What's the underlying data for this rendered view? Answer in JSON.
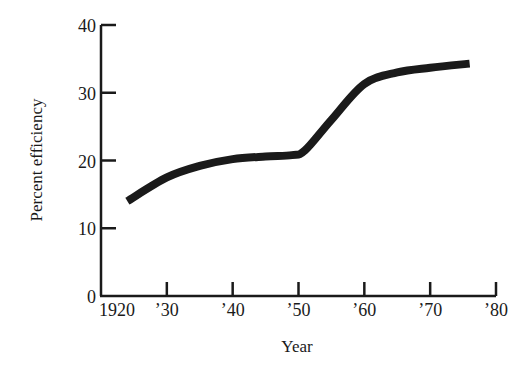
{
  "chart_data": {
    "type": "line",
    "title": "",
    "xlabel": "Year",
    "ylabel": "Percent efficiency",
    "xlim": [
      1920,
      1980
    ],
    "ylim": [
      0,
      40
    ],
    "x_ticks": [
      1920,
      1930,
      1940,
      1950,
      1960,
      1970,
      1980
    ],
    "x_tick_labels": [
      "1920",
      "’30",
      "’40",
      "’50",
      "’60",
      "’70",
      "’80"
    ],
    "y_ticks": [
      0,
      10,
      20,
      30,
      40
    ],
    "y_tick_labels": [
      "0",
      "10",
      "20",
      "30",
      "40"
    ],
    "grid": false,
    "legend": null,
    "series": [
      {
        "name": "Efficiency",
        "color": "#1a1a1a",
        "x": [
          1924,
          1930,
          1935,
          1940,
          1945,
          1949,
          1951,
          1955,
          1960,
          1965,
          1970,
          1976
        ],
        "y": [
          14.0,
          17.5,
          19.2,
          20.2,
          20.6,
          20.8,
          21.5,
          26.0,
          31.3,
          33.0,
          33.7,
          34.3
        ]
      }
    ]
  }
}
